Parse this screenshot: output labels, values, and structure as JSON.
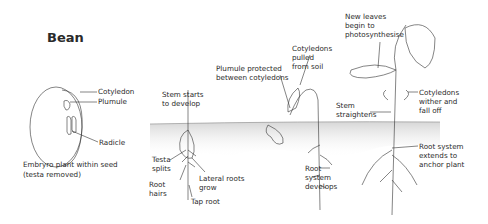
{
  "title": "Bean",
  "stages": {
    "seed": {
      "labels": {
        "cotyledon": "Cotyledon",
        "plumule": "Plumule",
        "radicle": "Radicle"
      },
      "caption_line1": "Embryro plant within seed",
      "caption_line2": "(testa removed)"
    },
    "germination": {
      "labels": {
        "stem_starts": "Stem starts\nto develop",
        "testa_splits": "Testa\nsplits",
        "root_hairs": "Root\nhairs",
        "lateral_roots": "Lateral roots\ngrow",
        "tap_root": "Tap root"
      }
    },
    "emergence": {
      "labels": {
        "plumule_protected": "Plumule protected\nbetween cotyledons",
        "cotyledons_pulled": "Cotyledons\npulled\nfrom soil",
        "root_system_develops": "Root\nsystem\ndevelops"
      }
    },
    "seedling": {
      "labels": {
        "new_leaves": "New leaves\nbegin to\nphotosynthesise",
        "stem_straightens": "Stem\nstraightens",
        "cotyledons_wither": "Cotyledons\nwither and\nfall off",
        "root_system_extends": "Root system\nextends to\nanchor plant"
      }
    }
  },
  "colors": {
    "ink": "#2a2a2a",
    "soil": "#e6e6e6",
    "background": "#ffffff"
  }
}
